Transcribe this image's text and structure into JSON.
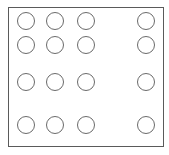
{
  "diagram": {
    "title": "",
    "frame": {
      "left": 8,
      "top": 7,
      "width": 156,
      "height": 140,
      "stroke": "#5a5a5a"
    },
    "pad_radius": 9,
    "pad_stroke": "#6a6a6a",
    "columns_x": [
      26,
      55,
      86,
      146
    ],
    "rows_y": [
      21,
      45,
      82,
      125
    ],
    "pad_count": 16
  }
}
